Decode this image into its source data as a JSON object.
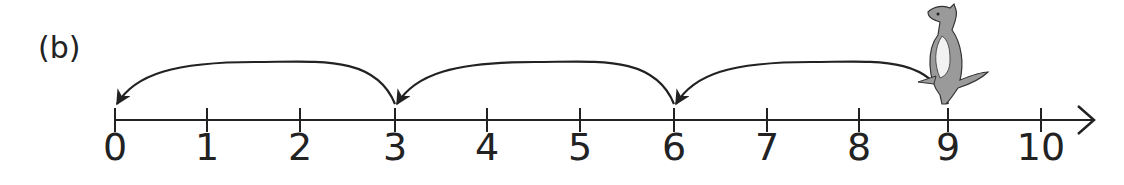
{
  "part_label": "(b)",
  "number_line": {
    "min": 0,
    "max": 10,
    "tick_labels": [
      "0",
      "1",
      "2",
      "3",
      "4",
      "5",
      "6",
      "7",
      "8",
      "9",
      "10"
    ],
    "tick_x": [
      115,
      207,
      300,
      395,
      487,
      580,
      674,
      767,
      859,
      948,
      1041
    ],
    "axis_y": 120,
    "arrow_end_x": 1095
  },
  "jumps": [
    {
      "from": 9,
      "to": 6
    },
    {
      "from": 6,
      "to": 3
    },
    {
      "from": 3,
      "to": 0
    }
  ],
  "character": {
    "name": "kangaroo",
    "position": 9
  },
  "colors": {
    "line": "#222222",
    "kangaroo_body": "#9a9a9a",
    "kangaroo_belly": "#f2f2f2"
  }
}
